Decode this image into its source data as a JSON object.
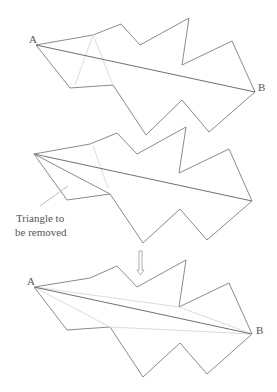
{
  "figures": [
    {
      "id": "before",
      "label_a": "A",
      "label_b": "B"
    },
    {
      "id": "triangle-removal",
      "annotation_line1": "Triangle to",
      "annotation_line2": "be removed"
    },
    {
      "id": "after",
      "label_a": "A",
      "label_b": "B"
    }
  ],
  "arrow": {
    "direction": "down",
    "icon": "hollow-down-arrow"
  },
  "colors": {
    "outline": "#8a8a8a",
    "diagonal": "#707070",
    "faint": "#dcdcdc",
    "text": "#555555"
  }
}
